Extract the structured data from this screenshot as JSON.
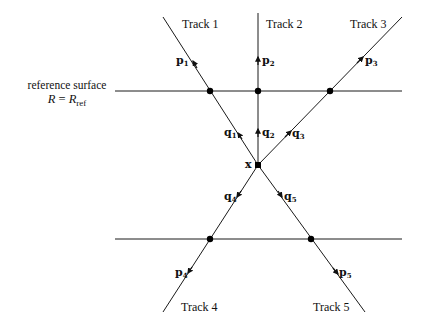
{
  "figure": {
    "reference_surface": {
      "label": "reference surface",
      "equation_lhs": "R",
      "equation_sign": "=",
      "equation_rhs_base": "R",
      "equation_rhs_sub": "ref"
    },
    "vertex": {
      "label": "x",
      "point": [
        258,
        165
      ]
    },
    "surfaces": [
      {
        "name": "upper-reference-line",
        "y": 91,
        "x1": 115,
        "x2": 402
      },
      {
        "name": "lower-reference-line",
        "y": 239,
        "x1": 115,
        "x2": 402
      }
    ],
    "tracks": [
      {
        "label": "Track 1",
        "start": [
          163,
          17
        ],
        "end": [
          258,
          165
        ],
        "intersection": [
          210,
          91
        ],
        "p_label": "p",
        "p_sub": "1",
        "p_arrow_at": [
          193,
          61
        ],
        "p_dir": "outward",
        "q_label": "q",
        "q_sub": "1",
        "q_arrow_at": [
          238,
          133
        ],
        "q_dir": "outward"
      },
      {
        "label": "Track 2",
        "start": [
          258,
          13
        ],
        "end": [
          258,
          165
        ],
        "intersection": [
          258,
          91
        ],
        "p_label": "p",
        "p_sub": "2",
        "p_arrow_at": [
          258,
          58
        ],
        "p_dir": "outward",
        "q_label": "q",
        "q_sub": "2",
        "q_arrow_at": [
          258,
          130
        ],
        "q_dir": "outward"
      },
      {
        "label": "Track 3",
        "start": [
          258,
          165
        ],
        "end": [
          402,
          17
        ],
        "intersection": [
          330,
          91
        ],
        "p_label": "p",
        "p_sub": "3",
        "p_arrow_at": [
          363,
          57
        ],
        "p_dir": "outward",
        "q_label": "q",
        "q_sub": "3",
        "q_arrow_at": [
          290,
          132
        ],
        "q_dir": "outward"
      },
      {
        "label": "Track 4",
        "start": [
          258,
          165
        ],
        "end": [
          163,
          312
        ],
        "intersection": [
          210,
          239
        ],
        "p_label": "p",
        "p_sub": "4",
        "p_arrow_at": [
          188,
          273
        ],
        "p_dir": "outward",
        "q_label": "q",
        "q_sub": "4",
        "q_arrow_at": [
          237,
          197
        ],
        "q_dir": "outward"
      },
      {
        "label": "Track 5",
        "start": [
          258,
          165
        ],
        "end": [
          365,
          312
        ],
        "intersection": [
          311,
          239
        ],
        "p_label": "p",
        "p_sub": "5",
        "p_arrow_at": [
          338,
          274
        ],
        "p_dir": "outward",
        "q_label": "q",
        "q_sub": "5",
        "q_arrow_at": [
          282,
          197
        ],
        "q_dir": "outward"
      }
    ],
    "colors": {
      "line": "#1a1a1a",
      "dot": "#000000",
      "background": "#ffffff"
    }
  }
}
